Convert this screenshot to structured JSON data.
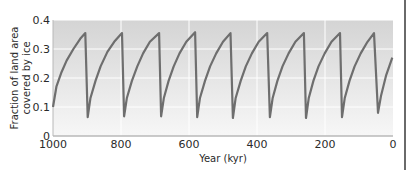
{
  "chart_data": {
    "type": "line",
    "title": "",
    "xlabel": "Year (kyr)",
    "ylabel": "Fraction of land area covered by ice",
    "ylabel_lines": [
      "Fraction of land area",
      "covered by ice"
    ],
    "xlim": [
      1000,
      0
    ],
    "ylim": [
      0,
      0.4
    ],
    "x_reversed": true,
    "grid": true,
    "x_ticks": [
      1000,
      800,
      600,
      400,
      200,
      0
    ],
    "x_tick_labels": [
      "1000",
      "800",
      "600",
      "400",
      "200",
      "0"
    ],
    "y_ticks": [
      0,
      0.1,
      0.2,
      0.3,
      0.4
    ],
    "y_tick_labels": [
      "0",
      "0.1",
      "0.2",
      "0.3",
      "0.4"
    ],
    "series": [
      {
        "name": "Ice cover fraction",
        "color": "#6e6e6e",
        "points": [
          [
            1000,
            0.1
          ],
          [
            990,
            0.17
          ],
          [
            975,
            0.22
          ],
          [
            960,
            0.26
          ],
          [
            940,
            0.3
          ],
          [
            920,
            0.335
          ],
          [
            905,
            0.355
          ],
          [
            898,
            0.065
          ],
          [
            890,
            0.13
          ],
          [
            875,
            0.19
          ],
          [
            860,
            0.24
          ],
          [
            840,
            0.29
          ],
          [
            820,
            0.325
          ],
          [
            797,
            0.355
          ],
          [
            791,
            0.068
          ],
          [
            783,
            0.13
          ],
          [
            768,
            0.19
          ],
          [
            752,
            0.24
          ],
          [
            735,
            0.285
          ],
          [
            715,
            0.325
          ],
          [
            688,
            0.355
          ],
          [
            682,
            0.068
          ],
          [
            674,
            0.13
          ],
          [
            660,
            0.19
          ],
          [
            645,
            0.24
          ],
          [
            628,
            0.285
          ],
          [
            608,
            0.325
          ],
          [
            582,
            0.358
          ],
          [
            576,
            0.065
          ],
          [
            568,
            0.13
          ],
          [
            553,
            0.19
          ],
          [
            538,
            0.24
          ],
          [
            520,
            0.285
          ],
          [
            500,
            0.325
          ],
          [
            478,
            0.355
          ],
          [
            471,
            0.062
          ],
          [
            463,
            0.13
          ],
          [
            448,
            0.19
          ],
          [
            433,
            0.24
          ],
          [
            415,
            0.285
          ],
          [
            395,
            0.325
          ],
          [
            370,
            0.355
          ],
          [
            362,
            0.065
          ],
          [
            354,
            0.13
          ],
          [
            340,
            0.19
          ],
          [
            325,
            0.24
          ],
          [
            307,
            0.285
          ],
          [
            287,
            0.325
          ],
          [
            262,
            0.355
          ],
          [
            256,
            0.062
          ],
          [
            248,
            0.13
          ],
          [
            234,
            0.19
          ],
          [
            219,
            0.24
          ],
          [
            201,
            0.285
          ],
          [
            181,
            0.325
          ],
          [
            156,
            0.355
          ],
          [
            150,
            0.065
          ],
          [
            142,
            0.13
          ],
          [
            128,
            0.19
          ],
          [
            113,
            0.24
          ],
          [
            95,
            0.285
          ],
          [
            75,
            0.325
          ],
          [
            56,
            0.355
          ],
          [
            44,
            0.08
          ],
          [
            35,
            0.14
          ],
          [
            20,
            0.21
          ],
          [
            2,
            0.27
          ]
        ]
      }
    ]
  },
  "colors": {
    "line": "#6e6e6e",
    "plot_top": "#d4d4d4",
    "plot_bottom": "#f7f7f7",
    "grid": "#ffffff",
    "axis": "#b8b8b8"
  }
}
